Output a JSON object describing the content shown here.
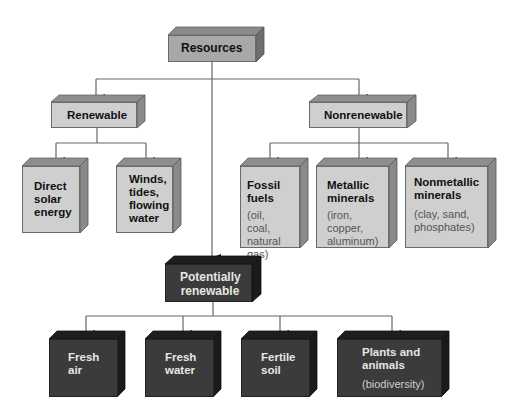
{
  "diagram": {
    "root": {
      "label": "Resources"
    },
    "categories": {
      "renewable": {
        "label": "Renewable",
        "children": [
          {
            "lines": [
              "Direct",
              "solar",
              "energy"
            ],
            "sub": []
          },
          {
            "lines": [
              "Winds,",
              "tides,",
              "flowing",
              "water"
            ],
            "sub": []
          }
        ]
      },
      "nonrenewable": {
        "label": "Nonrenewable",
        "children": [
          {
            "lines": [
              "Fossil",
              "fuels"
            ],
            "sub": [
              "(oil, coal,",
              "natural",
              "gas)"
            ]
          },
          {
            "lines": [
              "Metallic",
              "minerals"
            ],
            "sub": [
              "(iron,",
              "copper,",
              "aluminum)"
            ]
          },
          {
            "lines": [
              "Nonmetallic",
              "minerals"
            ],
            "sub": [
              "(clay, sand,",
              "phosphates)"
            ]
          }
        ]
      },
      "potentially_renewable": {
        "label_lines": [
          "Potentially",
          "renewable"
        ],
        "children": [
          {
            "lines": [
              "Fresh",
              "air"
            ],
            "sub": []
          },
          {
            "lines": [
              "Fresh",
              "water"
            ],
            "sub": []
          },
          {
            "lines": [
              "Fertile",
              "soil"
            ],
            "sub": []
          },
          {
            "lines": [
              "Plants and",
              "animals"
            ],
            "sub": [
              "(biodiversity)"
            ]
          }
        ]
      }
    },
    "colors": {
      "light_box": "#cfcfcf",
      "medium_box": "#a8a8a8",
      "dark_box": "#3b3b3b",
      "connector": "#555555"
    }
  }
}
